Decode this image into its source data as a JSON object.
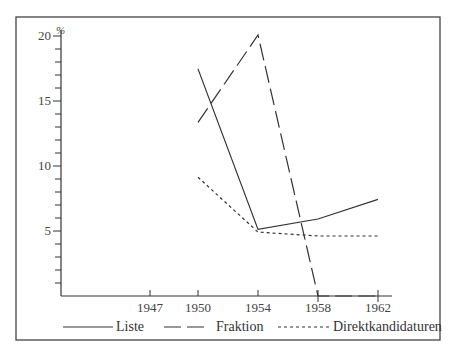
{
  "chart_data": {
    "type": "line",
    "title": "",
    "xlabel": "",
    "ylabel": "%",
    "ylim": [
      0,
      20
    ],
    "x_ticks": [
      "1947",
      "1950",
      "1954",
      "1958",
      "1962"
    ],
    "y_ticks": [
      "5",
      "10",
      "15",
      "20"
    ],
    "x": [
      1950,
      1954,
      1958,
      1962
    ],
    "series": [
      {
        "name": "Liste",
        "style": "solid",
        "values": [
          17.4,
          5.1,
          5.9,
          7.4
        ]
      },
      {
        "name": "Fraktion",
        "style": "long-dash",
        "values": [
          13.3,
          20.0,
          0,
          0
        ]
      },
      {
        "name": "Direktkandidaturen",
        "style": "dotted",
        "values": [
          9.1,
          4.9,
          4.6,
          4.6
        ]
      }
    ],
    "legend_position": "bottom",
    "grid": false
  },
  "axis": {
    "y_unit": "%",
    "y_labels": {
      "y20": "20",
      "y15": "15",
      "y10": "10",
      "y5": "5"
    },
    "x_labels": {
      "x1947": "1947",
      "x1950": "1950",
      "x1954": "1954",
      "x1958": "1958",
      "x1962": "1962"
    }
  },
  "legend": {
    "liste": "Liste",
    "fraktion": "Fraktion",
    "direkt": "Direktkandidaturen"
  },
  "colors": {
    "line": "#333333",
    "frame": "#444444"
  }
}
